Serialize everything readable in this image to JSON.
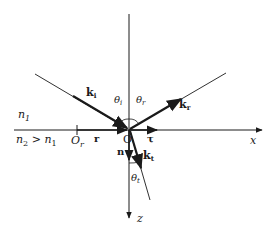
{
  "diagram": {
    "media": {
      "upper": "n",
      "upper_sub": "1",
      "lower_prefix": "n",
      "lower_sub": "2",
      "lower_rel": " > ",
      "lower_rhs": "n",
      "lower_rhs_sub": "1"
    },
    "axes": {
      "x_label": "x",
      "z_label": "z",
      "origin_label": "O",
      "normal_label": "n"
    },
    "points": {
      "ref_origin_label": "O",
      "ref_origin_sub": "r"
    },
    "vectors": {
      "r_label": "r",
      "tau_label": "τ",
      "incident": {
        "label": "k",
        "sub": "i"
      },
      "reflected": {
        "label": "k",
        "sub": "r"
      },
      "transmitted": {
        "label": "k",
        "sub": "t"
      }
    },
    "angles": {
      "incident": {
        "label": "θ",
        "sub": "i"
      },
      "reflected": {
        "label": "θ",
        "sub": "r"
      },
      "transmitted": {
        "label": "θ",
        "sub": "t"
      }
    },
    "colors": {
      "line": "#1a1a1a",
      "background": "#ffffff"
    }
  }
}
